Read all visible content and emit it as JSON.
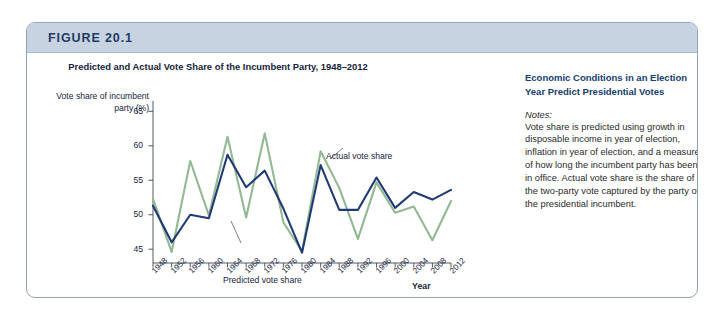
{
  "figure": {
    "label": "FIGURE 20.1",
    "frame_border_color": "#8fa3bd",
    "header_band_color": "#c7d3e0"
  },
  "side_panel": {
    "heading": "Economic Conditions in an Election Year Predict Presidential Votes",
    "notes_label": "Notes:",
    "notes_body": "Vote share is predicted using growth in disposable income in year of election, inflation in year of election, and a measure of how long the incumbent party has been in office. Actual vote share is the share of the two-party vote captured by the party of the presidential incumbent."
  },
  "annotations": {
    "actual": "Actual vote share",
    "predicted": "Predicted vote share"
  },
  "chart_data": {
    "type": "line",
    "title": "Predicted and Actual Vote Share of the Incumbent Party, 1948–2012",
    "xlabel": "Year",
    "ylabel": "Vote share of incumbent party (%)",
    "categories": [
      1948,
      1952,
      1956,
      1960,
      1964,
      1968,
      1972,
      1976,
      1980,
      1984,
      1988,
      1992,
      1996,
      2000,
      2004,
      2008,
      2012
    ],
    "xtick_labels": [
      "1948",
      "1952",
      "1956",
      "1960",
      "1964",
      "1968",
      "1972",
      "1976",
      "1980",
      "1984",
      "1988",
      "1992",
      "1996",
      "2000",
      "2004",
      "2008",
      "2012"
    ],
    "ytick_labels": [
      "45",
      "50",
      "55",
      "60",
      "65"
    ],
    "yticks": [
      45,
      50,
      55,
      60,
      65
    ],
    "ylim": [
      43,
      66.5
    ],
    "xlim": [
      1948,
      2012
    ],
    "grid": false,
    "legend": "annotated-inline",
    "series": [
      {
        "name": "Actual vote share",
        "color": "#93b894",
        "values": [
          52.3,
          44.6,
          57.8,
          49.9,
          61.3,
          49.6,
          61.8,
          48.9,
          44.7,
          59.2,
          53.9,
          46.5,
          54.7,
          50.3,
          51.2,
          46.3,
          52.0
        ]
      },
      {
        "name": "Predicted vote share",
        "color": "#203a73",
        "values": [
          51.3,
          46.0,
          50.0,
          49.5,
          58.7,
          54.0,
          56.4,
          50.9,
          44.5,
          57.2,
          50.7,
          50.7,
          55.4,
          51.0,
          53.3,
          52.2,
          53.6
        ]
      }
    ]
  }
}
